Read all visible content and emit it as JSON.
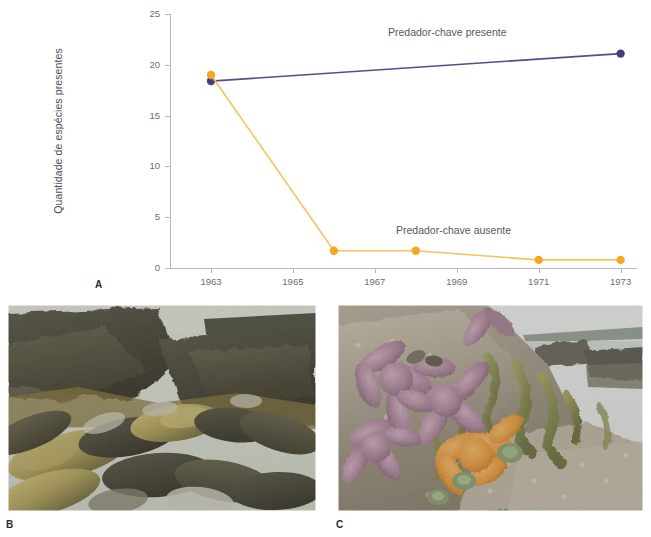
{
  "figure": {
    "panels": [
      {
        "letter": "A",
        "kind": "chart"
      },
      {
        "letter": "B",
        "kind": "photo",
        "subject": "mussel-bed-photo"
      },
      {
        "letter": "C",
        "kind": "photo",
        "subject": "sea-star-intertidal-photo"
      }
    ]
  },
  "chart_data": {
    "type": "line",
    "title": "",
    "xlabel": "",
    "ylabel": "Quantidade de espécies presentes",
    "x": [
      1963,
      1965,
      1967,
      1969,
      1971,
      1973
    ],
    "xtick_labels": [
      "1963",
      "1965",
      "1967",
      "1969",
      "1971",
      "1973"
    ],
    "xlim": [
      1962,
      1973.4
    ],
    "ylim": [
      0,
      25
    ],
    "yticks": [
      0,
      5,
      10,
      15,
      20,
      25
    ],
    "ytick_labels": [
      "0",
      "5",
      "10",
      "15",
      "20",
      "25"
    ],
    "grid": false,
    "legend_position": "inline-annotations",
    "series": [
      {
        "name": "Predador-chave presente",
        "color": "#5b4a8a",
        "marker_color": "#4b3b7a",
        "points": [
          {
            "x": 1963,
            "y": 18.4
          },
          {
            "x": 1973,
            "y": 21.1
          }
        ]
      },
      {
        "name": "Predador-chave ausente",
        "color": "#f6c35c",
        "marker_color": "#f5a623",
        "points": [
          {
            "x": 1963,
            "y": 19.0
          },
          {
            "x": 1966,
            "y": 1.7
          },
          {
            "x": 1968,
            "y": 1.7
          },
          {
            "x": 1971,
            "y": 0.8
          },
          {
            "x": 1973,
            "y": 0.8
          }
        ]
      }
    ],
    "annotations": [
      {
        "text": "Predador-chave presente",
        "x": 1969.0,
        "y": 23.6
      },
      {
        "text": "Predador-chave ausente",
        "x": 1969.2,
        "y": 4.3
      }
    ]
  },
  "photos": {
    "b": {
      "caption_letter": "B",
      "alt": "Dense bed of dark mussels covering intertidal rocks"
    },
    "c": {
      "caption_letter": "C",
      "alt": "Purple and orange sea stars on a rocky intertidal shore with seaweed and anemones"
    }
  },
  "colors": {
    "present_line": "#5b4a8a",
    "present_marker": "#4b3b7a",
    "absent_line": "#f6c35c",
    "absent_marker": "#f5a623",
    "axis": "#b8b8bb",
    "text": "#58585a"
  }
}
